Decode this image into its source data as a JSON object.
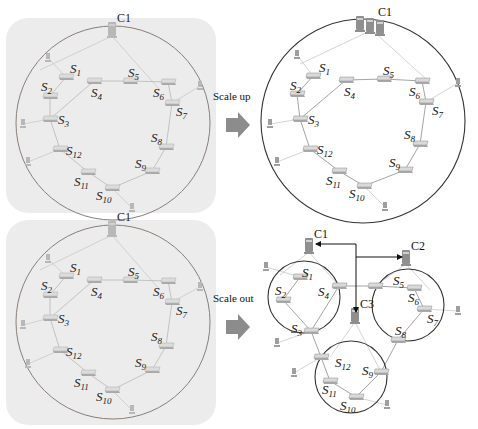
{
  "figure": {
    "transitions": [
      {
        "label": "Scale up",
        "x": 213,
        "y": 100,
        "arrow": {
          "x": 226,
          "y": 112
        }
      },
      {
        "label": "Scale out",
        "x": 213,
        "y": 302,
        "arrow": {
          "x": 226,
          "y": 314
        }
      }
    ],
    "panels": [
      {
        "id": "original-top",
        "faded": true,
        "background": {
          "x": 6,
          "y": 18,
          "w": 210,
          "h": 195,
          "r": 22
        },
        "rings": [
          {
            "cx": 113,
            "cy": 123,
            "r": 97
          }
        ],
        "controllers": [
          {
            "label": "C1",
            "x": 112,
            "y": 30,
            "servers": 1
          }
        ],
        "switches": [
          {
            "name": "S",
            "sub": "1",
            "x": 66,
            "y": 77,
            "lx": 70,
            "ly": 73
          },
          {
            "name": "S",
            "sub": "2",
            "x": 50,
            "y": 96,
            "lx": 41,
            "ly": 91
          },
          {
            "name": "S",
            "sub": "3",
            "x": 50,
            "y": 119,
            "lx": 58,
            "ly": 124
          },
          {
            "name": "S",
            "sub": "4",
            "x": 94,
            "y": 81,
            "lx": 91,
            "ly": 97
          },
          {
            "name": "S",
            "sub": "5",
            "x": 130,
            "y": 81,
            "lx": 128,
            "ly": 77
          },
          {
            "name": "S",
            "sub": "6",
            "x": 168,
            "y": 82,
            "lx": 153,
            "ly": 97
          },
          {
            "name": "S",
            "sub": "7",
            "x": 172,
            "y": 103,
            "lx": 176,
            "ly": 116
          },
          {
            "name": "S",
            "sub": "8",
            "x": 166,
            "y": 147,
            "lx": 151,
            "ly": 142
          },
          {
            "name": "S",
            "sub": "9",
            "x": 152,
            "y": 171,
            "lx": 135,
            "ly": 168
          },
          {
            "name": "S",
            "sub": "10",
            "x": 112,
            "y": 188,
            "lx": 96,
            "ly": 200
          },
          {
            "name": "S",
            "sub": "11",
            "x": 88,
            "y": 172,
            "lx": 74,
            "ly": 186
          },
          {
            "name": "S",
            "sub": "12",
            "x": 60,
            "y": 149,
            "lx": 66,
            "ly": 155
          }
        ],
        "hosts": [
          {
            "x": 48,
            "y": 58
          },
          {
            "x": 23,
            "y": 124
          },
          {
            "x": 28,
            "y": 162
          },
          {
            "x": 132,
            "y": 208
          },
          {
            "x": 200,
            "y": 86
          }
        ],
        "edges": [
          [
            0,
            1
          ],
          [
            1,
            2
          ],
          [
            2,
            3
          ],
          [
            3,
            4
          ],
          [
            4,
            5
          ],
          [
            5,
            6
          ],
          [
            6,
            7
          ],
          [
            7,
            8
          ],
          [
            8,
            9
          ],
          [
            9,
            10
          ],
          [
            10,
            11
          ],
          [
            11,
            2
          ]
        ],
        "host_edges": [
          [
            0,
            0
          ],
          [
            1,
            2
          ],
          [
            2,
            11
          ],
          [
            3,
            9
          ],
          [
            4,
            6
          ]
        ],
        "ctrl_edges": [
          [
            0,
            40,
            70
          ],
          [
            0,
            160,
            90
          ]
        ]
      },
      {
        "id": "scaled-up",
        "faded": false,
        "background": null,
        "rings": [
          {
            "cx": 363,
            "cy": 121,
            "r": 102
          }
        ],
        "controllers": [
          {
            "label": "C1",
            "x": 372,
            "y": 24,
            "servers": 3
          }
        ],
        "switches": [
          {
            "name": "S",
            "sub": "1",
            "x": 313,
            "y": 76,
            "lx": 319,
            "ly": 72
          },
          {
            "name": "S",
            "sub": "2",
            "x": 297,
            "y": 94,
            "lx": 290,
            "ly": 90
          },
          {
            "name": "S",
            "sub": "3",
            "x": 300,
            "y": 119,
            "lx": 308,
            "ly": 124
          },
          {
            "name": "S",
            "sub": "4",
            "x": 346,
            "y": 80,
            "lx": 344,
            "ly": 96
          },
          {
            "name": "S",
            "sub": "5",
            "x": 384,
            "y": 79,
            "lx": 383,
            "ly": 75
          },
          {
            "name": "S",
            "sub": "6",
            "x": 422,
            "y": 81,
            "lx": 409,
            "ly": 96
          },
          {
            "name": "S",
            "sub": "7",
            "x": 426,
            "y": 102,
            "lx": 432,
            "ly": 115
          },
          {
            "name": "S",
            "sub": "8",
            "x": 420,
            "y": 144,
            "lx": 404,
            "ly": 139
          },
          {
            "name": "S",
            "sub": "9",
            "x": 405,
            "y": 170,
            "lx": 389,
            "ly": 167
          },
          {
            "name": "S",
            "sub": "10",
            "x": 364,
            "y": 186,
            "lx": 349,
            "ly": 198
          },
          {
            "name": "S",
            "sub": "11",
            "x": 339,
            "y": 171,
            "lx": 326,
            "ly": 185
          },
          {
            "name": "S",
            "sub": "12",
            "x": 310,
            "y": 149,
            "lx": 317,
            "ly": 154
          }
        ],
        "hosts": [
          {
            "x": 297,
            "y": 55
          },
          {
            "x": 270,
            "y": 124
          },
          {
            "x": 277,
            "y": 162
          },
          {
            "x": 385,
            "y": 207
          },
          {
            "x": 458,
            "y": 83
          }
        ],
        "edges": [
          [
            0,
            1
          ],
          [
            1,
            2
          ],
          [
            2,
            3
          ],
          [
            3,
            4
          ],
          [
            4,
            5
          ],
          [
            5,
            6
          ],
          [
            6,
            7
          ],
          [
            7,
            8
          ],
          [
            8,
            9
          ],
          [
            9,
            10
          ],
          [
            10,
            11
          ],
          [
            11,
            2
          ]
        ],
        "host_edges": [
          [
            0,
            0
          ],
          [
            1,
            2
          ],
          [
            2,
            11
          ],
          [
            3,
            9
          ],
          [
            4,
            6
          ]
        ],
        "ctrl_edges": [
          [
            0,
            300,
            64
          ],
          [
            0,
            425,
            78
          ]
        ]
      },
      {
        "id": "original-bottom",
        "faded": true,
        "background": {
          "x": 6,
          "y": 220,
          "w": 210,
          "h": 205,
          "r": 22
        },
        "rings": [
          {
            "cx": 113,
            "cy": 322,
            "r": 97
          }
        ],
        "controllers": [
          {
            "label": "C1",
            "x": 112,
            "y": 229,
            "servers": 1
          }
        ],
        "switches": [
          {
            "name": "S",
            "sub": "1",
            "x": 66,
            "y": 276,
            "lx": 70,
            "ly": 272
          },
          {
            "name": "S",
            "sub": "2",
            "x": 50,
            "y": 295,
            "lx": 41,
            "ly": 290
          },
          {
            "name": "S",
            "sub": "3",
            "x": 50,
            "y": 318,
            "lx": 58,
            "ly": 323
          },
          {
            "name": "S",
            "sub": "4",
            "x": 94,
            "y": 280,
            "lx": 91,
            "ly": 296
          },
          {
            "name": "S",
            "sub": "5",
            "x": 130,
            "y": 280,
            "lx": 128,
            "ly": 276
          },
          {
            "name": "S",
            "sub": "6",
            "x": 168,
            "y": 281,
            "lx": 153,
            "ly": 296
          },
          {
            "name": "S",
            "sub": "7",
            "x": 172,
            "y": 302,
            "lx": 176,
            "ly": 315
          },
          {
            "name": "S",
            "sub": "8",
            "x": 166,
            "y": 346,
            "lx": 151,
            "ly": 341
          },
          {
            "name": "S",
            "sub": "9",
            "x": 152,
            "y": 370,
            "lx": 135,
            "ly": 367
          },
          {
            "name": "S",
            "sub": "10",
            "x": 112,
            "y": 390,
            "lx": 96,
            "ly": 401
          },
          {
            "name": "S",
            "sub": "11",
            "x": 88,
            "y": 373,
            "lx": 74,
            "ly": 387
          },
          {
            "name": "S",
            "sub": "12",
            "x": 60,
            "y": 350,
            "lx": 66,
            "ly": 356
          }
        ],
        "hosts": [
          {
            "x": 48,
            "y": 259
          },
          {
            "x": 23,
            "y": 325
          },
          {
            "x": 28,
            "y": 364
          },
          {
            "x": 132,
            "y": 410
          },
          {
            "x": 200,
            "y": 287
          }
        ],
        "edges": [
          [
            0,
            1
          ],
          [
            1,
            2
          ],
          [
            2,
            3
          ],
          [
            3,
            4
          ],
          [
            4,
            5
          ],
          [
            5,
            6
          ],
          [
            6,
            7
          ],
          [
            7,
            8
          ],
          [
            8,
            9
          ],
          [
            9,
            10
          ],
          [
            10,
            11
          ],
          [
            11,
            2
          ]
        ],
        "host_edges": [
          [
            0,
            0
          ],
          [
            1,
            2
          ],
          [
            2,
            11
          ],
          [
            3,
            9
          ],
          [
            4,
            6
          ]
        ],
        "ctrl_edges": [
          [
            0,
            40,
            270
          ],
          [
            0,
            160,
            290
          ]
        ]
      },
      {
        "id": "scaled-out",
        "faded": false,
        "background": null,
        "rings": [
          {
            "cx": 304,
            "cy": 297,
            "r": 36
          },
          {
            "cx": 408,
            "cy": 305,
            "r": 36
          },
          {
            "cx": 351,
            "cy": 377,
            "r": 36
          }
        ],
        "controllers": [
          {
            "label": "C1",
            "x": 309,
            "y": 246,
            "servers": 1
          },
          {
            "label": "C2",
            "x": 406,
            "y": 258,
            "servers": 1
          },
          {
            "label": "C3",
            "x": 355,
            "y": 316,
            "servers": 1
          }
        ],
        "switches": [
          {
            "name": "S",
            "sub": "1",
            "x": 300,
            "y": 277,
            "lx": 302,
            "ly": 277
          },
          {
            "name": "S",
            "sub": "2",
            "x": 283,
            "y": 300,
            "lx": 275,
            "ly": 295
          },
          {
            "name": "S",
            "sub": "3",
            "x": 311,
            "y": 331,
            "lx": 291,
            "ly": 333
          },
          {
            "name": "S",
            "sub": "4",
            "x": 339,
            "y": 286,
            "lx": 318,
            "ly": 296
          },
          {
            "name": "S",
            "sub": "5",
            "x": 375,
            "y": 286,
            "lx": 393,
            "ly": 285
          },
          {
            "name": "S",
            "sub": "6",
            "x": 414,
            "y": 288,
            "lx": 408,
            "ly": 302
          },
          {
            "name": "S",
            "sub": "7",
            "x": 424,
            "y": 309,
            "lx": 427,
            "ly": 323
          },
          {
            "name": "S",
            "sub": "8",
            "x": 398,
            "y": 340,
            "lx": 395,
            "ly": 335
          },
          {
            "name": "S",
            "sub": "9",
            "x": 381,
            "y": 372,
            "lx": 362,
            "ly": 375
          },
          {
            "name": "S",
            "sub": "10",
            "x": 356,
            "y": 397,
            "lx": 340,
            "ly": 410
          },
          {
            "name": "S",
            "sub": "11",
            "x": 330,
            "y": 381,
            "lx": 322,
            "ly": 394
          },
          {
            "name": "S",
            "sub": "12",
            "x": 321,
            "y": 357,
            "lx": 335,
            "ly": 367
          }
        ],
        "hosts": [
          {
            "x": 266,
            "y": 267
          },
          {
            "x": 277,
            "y": 343
          },
          {
            "x": 294,
            "y": 373
          },
          {
            "x": 387,
            "y": 405
          },
          {
            "x": 458,
            "y": 311
          }
        ],
        "edges": [
          [
            0,
            1
          ],
          [
            1,
            2
          ],
          [
            2,
            3
          ],
          [
            3,
            4
          ],
          [
            4,
            5
          ],
          [
            5,
            6
          ],
          [
            6,
            7
          ],
          [
            7,
            8
          ],
          [
            8,
            9
          ],
          [
            9,
            10
          ],
          [
            10,
            11
          ],
          [
            11,
            2
          ]
        ],
        "host_edges": [
          [
            0,
            0
          ],
          [
            1,
            2
          ],
          [
            2,
            11
          ],
          [
            3,
            9
          ],
          [
            4,
            6
          ]
        ],
        "ctrl_edges": [
          [
            0,
            280,
            275
          ],
          [
            0,
            339,
            286
          ],
          [
            1,
            375,
            286
          ],
          [
            1,
            430,
            290
          ],
          [
            2,
            330,
            357
          ],
          [
            2,
            381,
            372
          ]
        ],
        "ctrl_arrows": {
          "c1": {
            "x": 316,
            "y": 244
          },
          "c2": {
            "x": 402,
            "y": 257
          },
          "c3": {
            "x": 356,
            "y": 312
          },
          "junction": {
            "x": 356,
            "y": 244
          },
          "branch_y": 257
        }
      }
    ]
  }
}
